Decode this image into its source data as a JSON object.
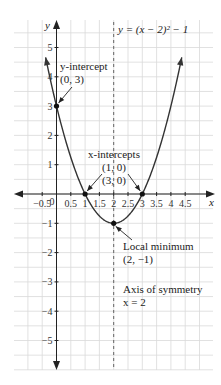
{
  "chart_data": {
    "type": "line",
    "title": "",
    "equation_label": "y = (x − 2)² − 1",
    "xlabel": "x",
    "ylabel": "y",
    "xlim": [
      -1.25,
      5.25
    ],
    "ylim": [
      -5.75,
      6.3
    ],
    "grid": true,
    "grid_step_x": 0.5,
    "grid_step_y": 0.5,
    "x_ticks": [
      -0.5,
      0,
      0.5,
      1,
      1.5,
      2,
      2.5,
      3,
      3.5,
      4,
      4.5
    ],
    "x_tick_labels": [
      "−0.5",
      "0",
      "0.5",
      "1",
      "1.5",
      "2",
      "2.5",
      "3",
      "3.5",
      "4",
      "4.5"
    ],
    "y_ticks": [
      5,
      4,
      3,
      2,
      1,
      -1,
      -2,
      -3,
      -4,
      -5
    ],
    "y_tick_labels": [
      "5",
      "4",
      "3",
      "2",
      "1",
      "−1",
      "−2",
      "−3",
      "−4",
      "−5"
    ],
    "series": [
      {
        "name": "y = (x − 2)² − 1",
        "function": "(x-2)^2-1",
        "x_range": [
          -0.38,
          4.38
        ]
      }
    ],
    "axis_of_symmetry": {
      "x": 2,
      "style": "dashed"
    },
    "points": [
      {
        "name": "y-intercept",
        "x": 0,
        "y": 3
      },
      {
        "name": "x-intercept-1",
        "x": 1,
        "y": 0
      },
      {
        "name": "x-intercept-2",
        "x": 3,
        "y": 0
      },
      {
        "name": "local-minimum",
        "x": 2,
        "y": -1
      }
    ],
    "annotations": [
      {
        "name": "y-intercept",
        "lines": [
          "y-intercept",
          "(0, 3)"
        ]
      },
      {
        "name": "x-intercepts",
        "lines": [
          "x-intercepts",
          "(1, 0)",
          "(3, 0)"
        ]
      },
      {
        "name": "local-minimum",
        "lines": [
          "Local minimum",
          "(2, −1)"
        ]
      },
      {
        "name": "axis-of-symmetry",
        "lines": [
          "Axis of symmetry",
          "x = 2"
        ]
      }
    ],
    "colors": {
      "curve": "#333333",
      "grid": "#d9d9d9",
      "axis": "#222222"
    }
  }
}
